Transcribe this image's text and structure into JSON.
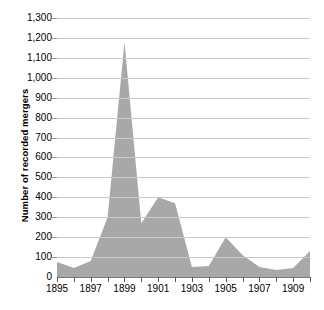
{
  "chart_data": {
    "type": "area",
    "title": "",
    "xlabel": "",
    "ylabel": "Number of recorded mergers",
    "xlim": [
      1895,
      1910
    ],
    "ylim": [
      0,
      1300
    ],
    "ytick_step": 100,
    "xtick_step": 1,
    "xtick_label_step": 2,
    "grid": true,
    "legend": false,
    "series_name": "Recorded mergers",
    "x": [
      1895,
      1896,
      1897,
      1898,
      1899,
      1900,
      1901,
      1902,
      1903,
      1904,
      1905,
      1906,
      1907,
      1908,
      1909,
      1910
    ],
    "values": [
      75,
      45,
      80,
      300,
      1180,
      270,
      400,
      370,
      50,
      55,
      200,
      110,
      50,
      35,
      45,
      130
    ],
    "yticks": [
      "0",
      "100",
      "200",
      "300",
      "400",
      "500",
      "600",
      "700",
      "800",
      "900",
      "1,000",
      "1,100",
      "1,200",
      "1,300"
    ],
    "xticks_labeled": [
      "1895",
      "1897",
      "1899",
      "1901",
      "1903",
      "1905",
      "1907",
      "1909"
    ],
    "colors": {
      "area_fill": "#a8a8a8",
      "gridline": "#c9c9c9",
      "axis": "#777777",
      "text": "#000000",
      "background": "#ffffff"
    }
  }
}
